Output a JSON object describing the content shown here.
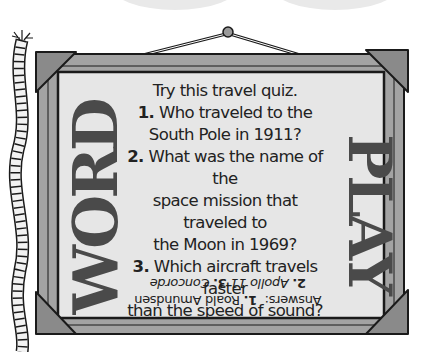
{
  "sign": {
    "title_left": "WORD",
    "title_right": "PLAY",
    "intro": "Try this travel quiz.",
    "questions": [
      {
        "num": "1.",
        "text_a": "Who traveled to the",
        "text_b": "South Pole in 1911?"
      },
      {
        "num": "2.",
        "text_a": "What was the name of the",
        "text_b": "space mission that traveled to",
        "text_c": "the Moon in 1969?"
      },
      {
        "num": "3.",
        "text_a": "Which aircraft travels faster",
        "text_b": "than the speed of sound?"
      }
    ],
    "answers": {
      "label": "Answers:",
      "a1_num": "1.",
      "a1": "Roald Amundsen",
      "a2_num": "2.",
      "a2": "Apollo 11",
      "a3_num": "3.",
      "a3": "Concorde"
    }
  },
  "colors": {
    "frame": "#a3a3a3",
    "corner": "#8a8a8a",
    "panel": "#e6e6e6",
    "title": "#4a4a4a",
    "outline": "#1a1a1a"
  }
}
